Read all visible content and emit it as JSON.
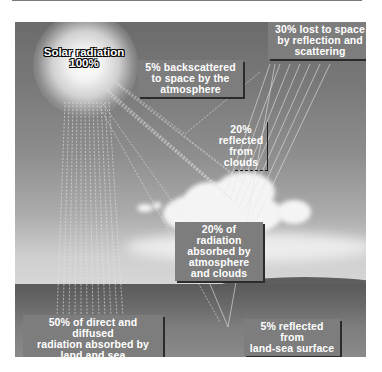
{
  "diagram": {
    "source": {
      "label": "Solar radiation",
      "value": "100%"
    },
    "labels": {
      "lost_to_space": "30% lost to space by reflection and scattering",
      "backscattered": "5% backscattered to space by the atmosphere",
      "reflected_clouds": "20% reflected from clouds",
      "absorbed_atmosphere": "20% of radiation absorbed by atmosphere and clouds",
      "absorbed_land_sea": "50% of direct and diffused radiation absorbed by land and sea",
      "reflected_surface": "5% reflected from land-sea surface"
    },
    "lines": {
      "lost_to_space": [
        "30% lost to space",
        "by reflection and",
        "scattering"
      ],
      "backscattered": [
        "5% backscattered",
        "to space by the",
        "atmosphere"
      ],
      "reflected_clouds": [
        "20%",
        "reflected",
        "from",
        "clouds"
      ],
      "absorbed_atmosphere": [
        "20% of radiation",
        "absorbed by",
        "atmosphere",
        "and clouds"
      ],
      "absorbed_land_sea": [
        "50% of direct and diffused",
        "radiation absorbed by",
        "land and sea"
      ],
      "reflected_surface": [
        "5% reflected from",
        "land-sea surface"
      ]
    },
    "budget": [
      {
        "name": "Lost to space (total)",
        "percent": 30
      },
      {
        "name": "Backscattered by atmosphere",
        "percent": 5
      },
      {
        "name": "Reflected from clouds",
        "percent": 20
      },
      {
        "name": "Reflected from land-sea surface",
        "percent": 5
      },
      {
        "name": "Absorbed by atmosphere and clouds",
        "percent": 20
      },
      {
        "name": "Absorbed by land and sea",
        "percent": 50
      }
    ],
    "colors": {
      "label_bg": "#7d7d7d",
      "label_text": "#ffffff",
      "ray": "#e8e8e8",
      "sky_top": "#6b6b6b",
      "ground": "#5e5e5e"
    }
  }
}
